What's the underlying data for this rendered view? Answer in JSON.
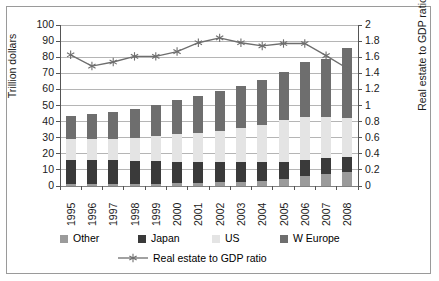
{
  "chart_data": {
    "type": "bar",
    "subtype": "stacked-bar-with-line-overlay",
    "title": "",
    "xlabel": "",
    "ylabel": "Trillion dollars",
    "y2label": "Real estate to GDP ratio",
    "ylim": [
      0,
      100
    ],
    "y2lim": [
      0,
      2
    ],
    "yticks": [
      "0",
      "10",
      "20",
      "30",
      "40",
      "50",
      "60",
      "70",
      "80",
      "90",
      "100"
    ],
    "y2ticks": [
      "0",
      "0.2",
      "0.4",
      "0.6",
      "0.8",
      "1",
      "1.2",
      "1.4",
      "1.6",
      "1.8",
      "2"
    ],
    "grid": true,
    "legend_position": "bottom",
    "categories": [
      "1995",
      "1996",
      "1997",
      "1998",
      "1999",
      "2000",
      "2001",
      "2002",
      "2003",
      "2004",
      "2005",
      "2006",
      "2007",
      "2008"
    ],
    "series": [
      {
        "name": "Other",
        "color": "#9b9b9b",
        "values": [
          1.0,
          1.0,
          1.0,
          1.2,
          1.4,
          1.6,
          2.0,
          2.3,
          2.6,
          3.2,
          4.2,
          6.0,
          7.5,
          8.6
        ]
      },
      {
        "name": "Japan",
        "color": "#3a3a3a",
        "values": [
          15.0,
          15.0,
          15.0,
          14.6,
          14.0,
          13.6,
          13.0,
          12.6,
          12.2,
          11.8,
          11.0,
          10.0,
          9.6,
          9.2
        ]
      },
      {
        "name": "US",
        "color": "#e4e4e4",
        "values": [
          13.0,
          13.2,
          13.5,
          14.2,
          15.5,
          16.8,
          18.0,
          19.4,
          21.2,
          23.0,
          25.8,
          27.0,
          26.0,
          24.2
        ]
      },
      {
        "name": "W Europe",
        "color": "#6e6e6e",
        "values": [
          14.5,
          15.8,
          16.5,
          18.0,
          19.6,
          21.5,
          23.0,
          24.7,
          26.0,
          28.0,
          30.0,
          34.0,
          35.9,
          44.0
        ]
      }
    ],
    "totals": [
      43.5,
      45.0,
      46.0,
      48.0,
      50.5,
      53.5,
      56.0,
      59.0,
      62.0,
      66.0,
      71.0,
      77.0,
      79.0,
      86.0
    ],
    "line_series": {
      "name": "Real estate to GDP ratio",
      "axis": "secondary",
      "marker": "asterisk",
      "color": "#6e6e6e",
      "values": [
        1.63,
        1.49,
        1.54,
        1.61,
        1.61,
        1.67,
        1.78,
        1.84,
        1.78,
        1.74,
        1.77,
        1.77,
        1.62,
        1.46
      ]
    }
  },
  "legend": {
    "items": [
      {
        "label": "Other",
        "color": "#9b9b9b"
      },
      {
        "label": "Japan",
        "color": "#3a3a3a"
      },
      {
        "label": "US",
        "color": "#e4e4e4"
      },
      {
        "label": "W Europe",
        "color": "#6e6e6e"
      }
    ],
    "line_label": "Real estate to GDP ratio"
  }
}
